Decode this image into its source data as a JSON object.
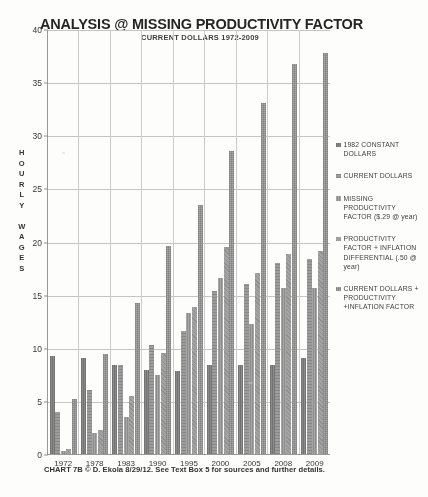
{
  "chart_data": {
    "type": "bar",
    "title": "ANALYSIS @ MISSING PRODUCTIVITY FACTOR",
    "subtitle": "CURRENT DOLLARS  1972-2009",
    "xlabel": "",
    "ylabel": "HOURLY WAGES",
    "ylim": [
      0,
      40
    ],
    "yticks": [
      0,
      5,
      10,
      15,
      20,
      25,
      30,
      35,
      40
    ],
    "grid": true,
    "legend_position": "right",
    "categories": [
      "1972",
      "1978",
      "1983",
      "1990",
      "1995",
      "2000",
      "2005",
      "2008",
      "2009"
    ],
    "series": [
      {
        "name": "1982 CONSTANT DOLLARS",
        "values": [
          9.2,
          9.0,
          8.4,
          7.9,
          7.8,
          8.4,
          8.4,
          8.4,
          9.0
        ]
      },
      {
        "name": "CURRENT DOLLARS",
        "values": [
          4.0,
          6.0,
          8.4,
          10.3,
          11.6,
          15.3,
          16.0,
          18.0,
          18.4
        ]
      },
      {
        "name": "MISSING PRODUCTIVITY FACTOR ($.29 @ year)",
        "values": [
          0.3,
          2.0,
          3.5,
          7.4,
          13.3,
          16.6,
          12.2,
          15.6,
          15.6
        ]
      },
      {
        "name": "PRODUCTIVITY FACTOR + INFLATION DIFFERENTIAL ($.50 @ year)",
        "values": [
          0.5,
          2.3,
          5.5,
          9.5,
          13.8,
          19.5,
          17.0,
          18.8,
          19.1
        ]
      },
      {
        "name": "CURRENT DOLLARS + PRODUCTIVITY +INFLATION FACTOR",
        "values": [
          5.2,
          9.4,
          14.2,
          19.6,
          23.4,
          28.5,
          33.0,
          36.7,
          37.7
        ]
      }
    ],
    "series_colors": [
      "#8b8b8b",
      "#9d9d9d",
      "#8f8f8f",
      "#a5a5a5",
      "#a8a8a8"
    ]
  },
  "legend": {
    "items": [
      "1982 CONSTANT DOLLARS",
      "CURRENT DOLLARS",
      "MISSING PRODUCTIVITY FACTOR ($.29 @ year)",
      "PRODUCTIVITY FACTOR + INFLATION DIFFERENTIAL (.50 @ year)",
      "CURRENT DOLLARS + PRODUCTIVITY +INFLATION FACTOR"
    ]
  },
  "footer": {
    "caption": "CHART 7B © D. Ekola 8/29/12.  See Text Box 5 for sources and further details."
  }
}
